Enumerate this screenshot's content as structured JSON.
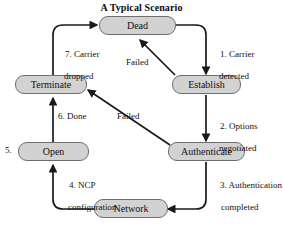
{
  "figure": {
    "title": "A Typical Scenario",
    "type": "state-transition-diagram",
    "colors": {
      "node_fill": "#d2d2d2",
      "node_border": "#6e6e6e",
      "edge": "#1a1a1a",
      "text": "#111111",
      "background": "#ffffff"
    }
  },
  "nodes": [
    {
      "id": "dead",
      "label": "Dead"
    },
    {
      "id": "establish",
      "label": "Establish"
    },
    {
      "id": "authenticate",
      "label": "Authenticate"
    },
    {
      "id": "network",
      "label": "Network"
    },
    {
      "id": "open",
      "label": "Open"
    },
    {
      "id": "terminate",
      "label": "Terminate"
    }
  ],
  "edges": [
    {
      "id": "e1",
      "from": "dead",
      "to": "establish",
      "label_line1": "1. Carrier",
      "label_line2": "detected"
    },
    {
      "id": "e2",
      "from": "establish",
      "to": "authenticate",
      "label_line1": "2. Options",
      "label_line2": "negotiated"
    },
    {
      "id": "e3",
      "from": "authenticate",
      "to": "network",
      "label_line1": "3. Authentication",
      "label_line2": "completed"
    },
    {
      "id": "e4",
      "from": "network",
      "to": "open",
      "label_line1": "4. NCP",
      "label_line2": "configuration"
    },
    {
      "id": "e5",
      "from": "open",
      "to": "terminate",
      "label_line1": "6. Done",
      "label_line2": ""
    },
    {
      "id": "e6",
      "from": "terminate",
      "to": "dead",
      "label_line1": "7. Carrier",
      "label_line2": "dropped"
    },
    {
      "id": "e7",
      "from": "establish",
      "to": "dead",
      "label_line1": "Failed",
      "label_line2": ""
    },
    {
      "id": "e8",
      "from": "authenticate",
      "to": "terminate",
      "label_line1": "Failed",
      "label_line2": ""
    }
  ],
  "markers": [
    {
      "id": "m5",
      "label": "5."
    }
  ]
}
